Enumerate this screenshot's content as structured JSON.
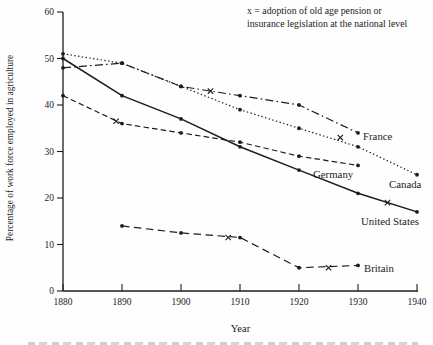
{
  "figure": {
    "note_line1": "x = adoption of old age pension or",
    "note_line2": "insurance legislation at the national level",
    "y_axis_label": "Percentage of work force employed in agriculture",
    "x_axis_label": "Year"
  },
  "chart_data": {
    "type": "line",
    "title": "",
    "xlabel": "Year",
    "ylabel": "Percentage of work force employed in agriculture",
    "annotation": "x = adoption of old age pension or insurance legislation at the national level",
    "xlim": [
      1880,
      1940
    ],
    "ylim": [
      0,
      60
    ],
    "x_ticks": [
      1880,
      1890,
      1900,
      1910,
      1920,
      1930,
      1940
    ],
    "y_ticks": [
      0,
      10,
      20,
      30,
      40,
      50,
      60
    ],
    "grid": false,
    "legend": "inline-end-labels",
    "marker": "filled-dot",
    "adoption_marker_glyph": "x",
    "line_color": "#1c1c1c",
    "series": [
      {
        "name": "Canada",
        "line_style": "dotted",
        "x": [
          1880,
          1890,
          1900,
          1910,
          1920,
          1930,
          1940
        ],
        "values": [
          51,
          49,
          44,
          39,
          35,
          31,
          25
        ],
        "adoption_marks": [
          {
            "year": 1927,
            "value": 33
          }
        ],
        "label": {
          "text": "Canada",
          "px": 389,
          "py": 188
        }
      },
      {
        "name": "France",
        "line_style": "dashdot",
        "x": [
          1880,
          1890,
          1900,
          1910,
          1920,
          1930
        ],
        "values": [
          48,
          49,
          44,
          42,
          40,
          34
        ],
        "adoption_marks": [
          {
            "year": 1905,
            "value": 43
          }
        ],
        "label": {
          "text": "France",
          "px": 363,
          "py": 140
        }
      },
      {
        "name": "United States",
        "line_style": "solid",
        "x": [
          1880,
          1890,
          1900,
          1910,
          1920,
          1930,
          1940
        ],
        "values": [
          50,
          42,
          37,
          31,
          26,
          21,
          17
        ],
        "adoption_marks": [
          {
            "year": 1935,
            "value": 19
          }
        ],
        "label": {
          "text": "United States",
          "px": 361,
          "py": 225
        }
      },
      {
        "name": "Germany",
        "line_style": "dashed",
        "x": [
          1880,
          1890,
          1900,
          1910,
          1920,
          1930
        ],
        "values": [
          42,
          36,
          34,
          32,
          29,
          27
        ],
        "adoption_marks": [
          {
            "year": 1889,
            "value": 36.5
          }
        ],
        "label": {
          "text": "Germany",
          "px": 313,
          "py": 178
        }
      },
      {
        "name": "Britain",
        "line_style": "long-dash",
        "x": [
          1890,
          1900,
          1910,
          1920,
          1930
        ],
        "values": [
          14,
          12.5,
          11.5,
          5,
          5.5
        ],
        "adoption_marks": [
          {
            "year": 1908,
            "value": 11.5
          },
          {
            "year": 1925,
            "value": 5
          }
        ],
        "label": {
          "text": "Britain",
          "px": 364,
          "py": 272
        }
      }
    ]
  }
}
